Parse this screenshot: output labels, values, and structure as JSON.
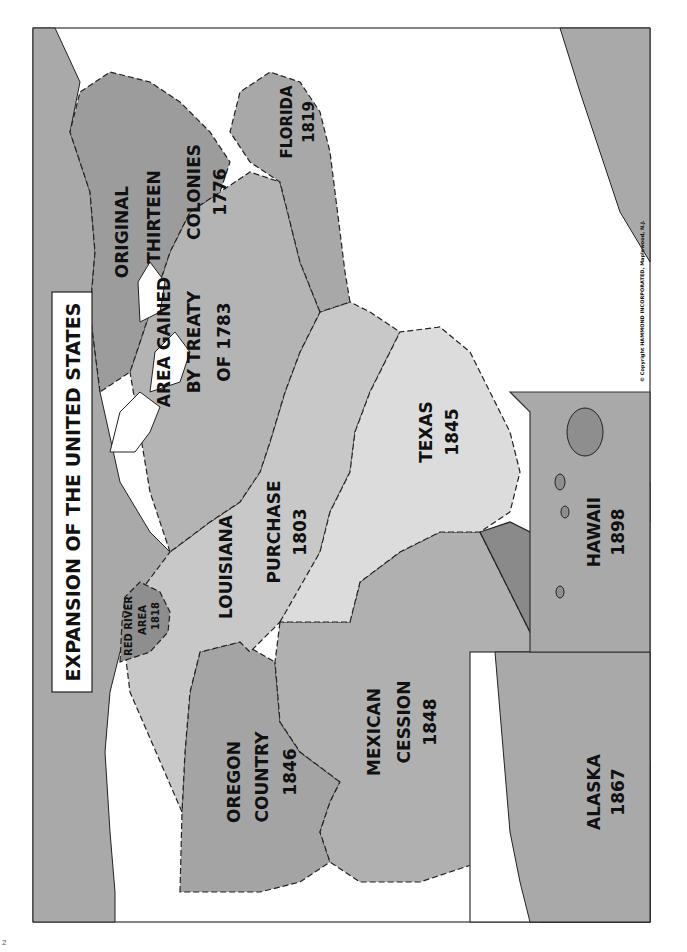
{
  "map": {
    "title": "EXPANSION OF THE UNITED STATES",
    "orientation": "rotated 90° counter-clockwise (landscape map on portrait page)",
    "copyright": "© Copyright HAMMOND INCORPORATED, Maplewood, N.J.",
    "colors": {
      "original_thirteen": "#9c9c9c",
      "treaty_1783": "#b4b4b4",
      "louisiana": "#c8c8c8",
      "red_river": "#8e8e8e",
      "florida": "#a8a8a8",
      "texas": "#dcdcdc",
      "oregon": "#a4a4a4",
      "mexican_cession": "#b0b0b0",
      "gadsden": "#8a8a8a",
      "foreign_land": "#a9a9a9",
      "water": "#ffffff",
      "border": "#1a1a1a"
    },
    "regions": [
      {
        "id": "original-thirteen",
        "lines": [
          "ORIGINAL",
          "THIRTEEN",
          "COLONIES",
          "1776"
        ]
      },
      {
        "id": "treaty-1783",
        "lines": [
          "AREA GAINED",
          "BY TREATY",
          "OF 1783"
        ]
      },
      {
        "id": "louisiana-purchase",
        "lines": [
          "LOUISIANA",
          "PURCHASE",
          "1803"
        ]
      },
      {
        "id": "red-river",
        "lines": [
          "RED RIVER",
          "AREA",
          "1818"
        ]
      },
      {
        "id": "florida",
        "lines": [
          "FLORIDA",
          "1819"
        ]
      },
      {
        "id": "texas",
        "lines": [
          "TEXAS",
          "1845"
        ]
      },
      {
        "id": "oregon-country",
        "lines": [
          "OREGON",
          "COUNTRY",
          "1846"
        ]
      },
      {
        "id": "mexican-cession",
        "lines": [
          "MEXICAN",
          "CESSION",
          "1848"
        ]
      },
      {
        "id": "gadsden-purchase",
        "lines": [
          "GADSDEN",
          "PURCHASE",
          "1853"
        ]
      }
    ],
    "insets": [
      {
        "id": "alaska",
        "lines": [
          "ALASKA",
          "1867"
        ]
      },
      {
        "id": "hawaii",
        "lines": [
          "HAWAII",
          "1898"
        ]
      }
    ],
    "corner_mark": "2"
  }
}
